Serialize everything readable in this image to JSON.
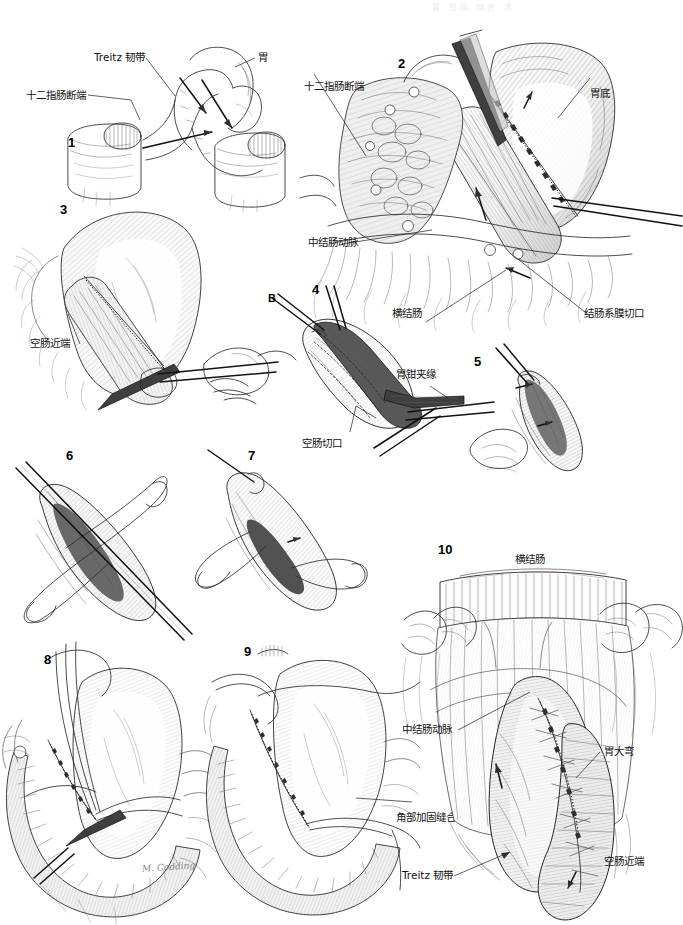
{
  "page": {
    "top_header_faint": "胃 空肠 吻合 术",
    "artist_signature": "M. Codding",
    "background_color": "#ffffff",
    "ink_color": "#2a2a2a"
  },
  "panels": [
    {
      "number": "1",
      "labels": [
        {
          "text": "十二指肠断端",
          "id": "duodenal-stump"
        },
        {
          "text": "Treitz 韧带",
          "id": "ligament-of-treitz"
        },
        {
          "text": "胃",
          "id": "stomach"
        }
      ]
    },
    {
      "number": "2",
      "labels": [
        {
          "text": "十二指肠断端",
          "id": "duodenal-stump"
        },
        {
          "text": "胃底",
          "id": "gastric-fundus"
        },
        {
          "text": "中结肠动脉",
          "id": "middle-colic-artery"
        },
        {
          "text": "横结肠",
          "id": "transverse-colon"
        },
        {
          "text": "结肠系膜切口",
          "id": "mesocolon-incision"
        }
      ]
    },
    {
      "number": "3",
      "labels": [
        {
          "text": "空肠近端",
          "id": "proximal-jejunum"
        }
      ]
    },
    {
      "number": "4",
      "marker": "B",
      "labels": [
        {
          "text": "胃钳夹缘",
          "id": "gastric-clamp-edge"
        },
        {
          "text": "空肠切口",
          "id": "jejunal-incision"
        }
      ]
    },
    {
      "number": "5",
      "labels": []
    },
    {
      "number": "6",
      "labels": []
    },
    {
      "number": "7",
      "labels": []
    },
    {
      "number": "8",
      "labels": []
    },
    {
      "number": "9",
      "labels": [
        {
          "text": "角部加固缝合",
          "id": "corner-reinforcing-suture"
        }
      ]
    },
    {
      "number": "10",
      "labels": [
        {
          "text": "横结肠",
          "id": "transverse-colon"
        },
        {
          "text": "中结肠动脉",
          "id": "middle-colic-artery"
        },
        {
          "text": "胃大弯",
          "id": "greater-curvature"
        },
        {
          "text": "角部加固缝合",
          "id": "corner-reinforcing-suture"
        },
        {
          "text": "Treitz 韧带",
          "id": "ligament-of-treitz"
        },
        {
          "text": "空肠近端",
          "id": "proximal-jejunum"
        }
      ]
    }
  ]
}
